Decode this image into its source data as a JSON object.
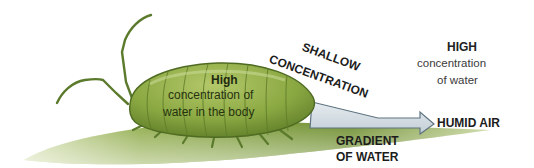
{
  "diagram": {
    "body_label": {
      "line0": "High",
      "line1": "concentration of",
      "line2": "water in the body"
    },
    "slope_label": {
      "line1": "SHALLOW",
      "line2": "CONCENTRATION"
    },
    "air_label": {
      "line1": "HIGH",
      "line2": "concentration",
      "line3": "of water"
    },
    "arrow_target": "HUMID AIR",
    "gradient_label": {
      "line1": "GRADIENT",
      "line2": "OF WATER"
    },
    "colors": {
      "insect_body": "#8aa842",
      "insect_dark": "#56722a",
      "leaf": "#7f9e3c",
      "arrow_fill": "#d4dde4",
      "arrow_stroke": "#5f7480",
      "text": "#1c1c1c"
    }
  }
}
